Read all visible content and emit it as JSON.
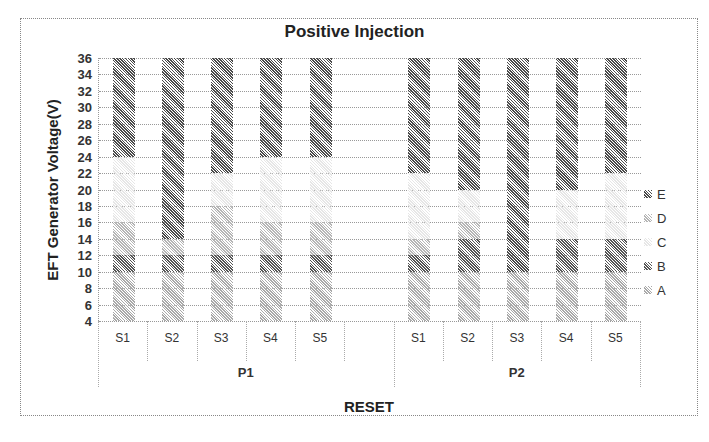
{
  "chart_data": {
    "type": "bar",
    "stacked": true,
    "title": "Positive Injection",
    "xlabel": "RESET",
    "ylabel": "EFT Generator Voltage(V)",
    "ylim": [
      4,
      36
    ],
    "yticks": [
      4,
      6,
      8,
      10,
      12,
      14,
      16,
      18,
      20,
      22,
      24,
      26,
      28,
      30,
      32,
      34,
      36
    ],
    "groups": [
      "P1",
      "P2"
    ],
    "categories": [
      "S1",
      "S2",
      "S3",
      "S4",
      "S5",
      "S1",
      "S2",
      "S3",
      "S4",
      "S5"
    ],
    "legend": [
      "E",
      "D",
      "C",
      "B",
      "A"
    ],
    "legend_position": "right",
    "grid": true,
    "colors": {
      "A": "#a9a9a9",
      "B": "#555555",
      "C": "#e6e6e6",
      "D": "#b5b5b5",
      "E": "#4a4a4a"
    },
    "bars": [
      {
        "group": "P1",
        "cat": "S1",
        "segments": [
          {
            "s": "A",
            "from": 4,
            "to": 10
          },
          {
            "s": "B",
            "from": 10,
            "to": 12
          },
          {
            "s": "D",
            "from": 12,
            "to": 16
          },
          {
            "s": "C",
            "from": 16,
            "to": 24
          },
          {
            "s": "E",
            "from": 24,
            "to": 36
          }
        ]
      },
      {
        "group": "P1",
        "cat": "S2",
        "segments": [
          {
            "s": "A",
            "from": 4,
            "to": 10
          },
          {
            "s": "B",
            "from": 10,
            "to": 12
          },
          {
            "s": "D",
            "from": 12,
            "to": 14
          },
          {
            "s": "E",
            "from": 14,
            "to": 36
          }
        ]
      },
      {
        "group": "P1",
        "cat": "S3",
        "segments": [
          {
            "s": "A",
            "from": 4,
            "to": 10
          },
          {
            "s": "B",
            "from": 10,
            "to": 12
          },
          {
            "s": "D",
            "from": 12,
            "to": 18
          },
          {
            "s": "C",
            "from": 18,
            "to": 22
          },
          {
            "s": "E",
            "from": 22,
            "to": 36
          }
        ]
      },
      {
        "group": "P1",
        "cat": "S4",
        "segments": [
          {
            "s": "A",
            "from": 4,
            "to": 10
          },
          {
            "s": "B",
            "from": 10,
            "to": 12
          },
          {
            "s": "D",
            "from": 12,
            "to": 16
          },
          {
            "s": "C",
            "from": 16,
            "to": 24
          },
          {
            "s": "E",
            "from": 24,
            "to": 36
          }
        ]
      },
      {
        "group": "P1",
        "cat": "S5",
        "segments": [
          {
            "s": "A",
            "from": 4,
            "to": 10
          },
          {
            "s": "B",
            "from": 10,
            "to": 12
          },
          {
            "s": "D",
            "from": 12,
            "to": 16
          },
          {
            "s": "C",
            "from": 16,
            "to": 24
          },
          {
            "s": "E",
            "from": 24,
            "to": 36
          }
        ]
      },
      {
        "group": "P2",
        "cat": "S1",
        "segments": [
          {
            "s": "A",
            "from": 4,
            "to": 10
          },
          {
            "s": "B",
            "from": 10,
            "to": 12
          },
          {
            "s": "D",
            "from": 12,
            "to": 14
          },
          {
            "s": "C",
            "from": 14,
            "to": 22
          },
          {
            "s": "E",
            "from": 22,
            "to": 36
          }
        ]
      },
      {
        "group": "P2",
        "cat": "S2",
        "segments": [
          {
            "s": "A",
            "from": 4,
            "to": 10
          },
          {
            "s": "B",
            "from": 10,
            "to": 14
          },
          {
            "s": "D",
            "from": 14,
            "to": 16
          },
          {
            "s": "C",
            "from": 16,
            "to": 20
          },
          {
            "s": "E",
            "from": 20,
            "to": 36
          }
        ]
      },
      {
        "group": "P2",
        "cat": "S3",
        "segments": [
          {
            "s": "A",
            "from": 4,
            "to": 10
          },
          {
            "s": "E",
            "from": 10,
            "to": 36
          }
        ]
      },
      {
        "group": "P2",
        "cat": "S4",
        "segments": [
          {
            "s": "A",
            "from": 4,
            "to": 10
          },
          {
            "s": "B",
            "from": 10,
            "to": 14
          },
          {
            "s": "C",
            "from": 14,
            "to": 20
          },
          {
            "s": "E",
            "from": 20,
            "to": 36
          }
        ]
      },
      {
        "group": "P2",
        "cat": "S5",
        "segments": [
          {
            "s": "A",
            "from": 4,
            "to": 10
          },
          {
            "s": "B",
            "from": 10,
            "to": 14
          },
          {
            "s": "C",
            "from": 14,
            "to": 22
          },
          {
            "s": "E",
            "from": 22,
            "to": 36
          }
        ]
      }
    ]
  }
}
